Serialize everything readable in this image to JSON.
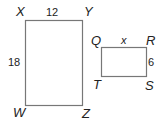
{
  "figure": {
    "type": "similar-rectangles",
    "rect_large": {
      "vertices": {
        "top_left": "X",
        "top_right": "Y",
        "bottom_right": "Z",
        "bottom_left": "W"
      },
      "side_top": "12",
      "side_left": "18"
    },
    "rect_small": {
      "vertices": {
        "top_left": "Q",
        "top_right": "R",
        "bottom_right": "S",
        "bottom_left": "T"
      },
      "side_top": "x",
      "side_right": "6"
    },
    "colors": {
      "stroke": "#777777",
      "text": "#222222"
    }
  }
}
